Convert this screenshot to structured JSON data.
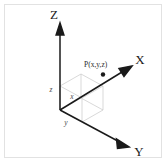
{
  "figure": {
    "background_color": "#ffffff",
    "frame_color": "#e2e2e2",
    "axis_color": "#1a1a1a",
    "wireframe_color": "#c9c9c9",
    "point_color": "#1a1a1a"
  },
  "axes": {
    "z_label": "Z",
    "x_label": "X",
    "y_label": "Y"
  },
  "coordinates": {
    "z_component_label": "z",
    "x_component_label": "x",
    "y_component_label": "y"
  },
  "point": {
    "label": "P(x,y,z)",
    "marker": "filled-dot"
  }
}
